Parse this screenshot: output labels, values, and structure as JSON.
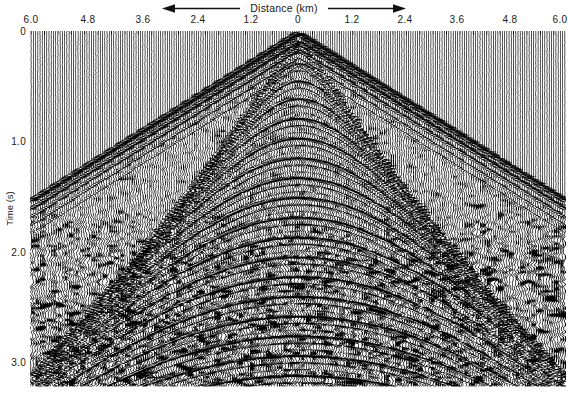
{
  "figure": {
    "kind": "seismic-shot-gather",
    "background_color": "#ffffff",
    "trace_color": "#000000"
  },
  "x_axis": {
    "title": "Distance (km)",
    "title_position": "top",
    "left_arrow": "left-arrow-icon",
    "right_arrow": "right-arrow-icon",
    "tick_labels": [
      "6.0",
      "4.8",
      "3.6",
      "2.4",
      "1.2",
      "0",
      "1.2",
      "2.4",
      "3.6",
      "4.8",
      "6.0"
    ],
    "tick_values": [
      -6.0,
      -4.8,
      -3.6,
      -2.4,
      -1.2,
      0,
      1.2,
      2.4,
      3.6,
      4.8,
      6.0
    ],
    "tick_x_px": [
      31,
      88,
      143,
      198,
      251,
      298,
      352,
      405,
      457,
      510,
      560
    ],
    "range": [
      -6.0,
      6.0
    ],
    "units": "km"
  },
  "y_axis": {
    "title": "Time (s)",
    "tick_labels": [
      "0",
      "1.0",
      "2.0",
      "3.0"
    ],
    "tick_values": [
      0,
      1.0,
      2.0,
      3.0
    ],
    "tick_y_px": [
      31,
      141,
      252,
      362
    ],
    "range": [
      0,
      3.24
    ],
    "units": "s",
    "direction": "increasing-downward"
  },
  "plot_area": {
    "left_px": 30,
    "top_px": 31,
    "right_px": 566,
    "bottom_px": 387
  },
  "chart_data": {
    "type": "wiggle-seismic",
    "title": "Distance (km)",
    "xlabel": "Distance (km)",
    "ylabel": "Time (s)",
    "xlim": [
      -6.0,
      6.0
    ],
    "ylim": [
      0,
      3.24
    ],
    "grid": false,
    "legend": "none",
    "n_traces": 240,
    "trace_spacing_km": 0.05,
    "sample_rate_hz": 250,
    "events": [
      {
        "name": "direct-arrival-left",
        "type": "linear",
        "t0": 0.02,
        "slope_s_per_km": 0.255,
        "amplitude": 0.95
      },
      {
        "name": "direct-arrival-right",
        "type": "linear",
        "t0": 0.02,
        "slope_s_per_km": 0.255,
        "amplitude": 0.95
      },
      {
        "name": "reflection-1",
        "type": "hyperbolic",
        "t0": 0.14,
        "velocity_km_s": 1.6,
        "amplitude": 0.55
      },
      {
        "name": "reflection-2",
        "type": "hyperbolic",
        "t0": 0.3,
        "velocity_km_s": 1.7,
        "amplitude": 0.6
      },
      {
        "name": "reflection-3",
        "type": "hyperbolic",
        "t0": 0.46,
        "velocity_km_s": 1.78,
        "amplitude": 0.62
      },
      {
        "name": "reflection-4",
        "type": "hyperbolic",
        "t0": 0.62,
        "velocity_km_s": 1.85,
        "amplitude": 0.66
      },
      {
        "name": "reflection-5",
        "type": "hyperbolic",
        "t0": 0.8,
        "velocity_km_s": 1.92,
        "amplitude": 0.7
      },
      {
        "name": "reflection-6",
        "type": "hyperbolic",
        "t0": 0.98,
        "velocity_km_s": 1.98,
        "amplitude": 0.72
      },
      {
        "name": "reflection-7",
        "type": "hyperbolic",
        "t0": 1.16,
        "velocity_km_s": 2.05,
        "amplitude": 0.74
      },
      {
        "name": "reflection-8",
        "type": "hyperbolic",
        "t0": 1.34,
        "velocity_km_s": 2.12,
        "amplitude": 0.76
      },
      {
        "name": "reflection-9",
        "type": "hyperbolic",
        "t0": 1.52,
        "velocity_km_s": 2.18,
        "amplitude": 0.78
      },
      {
        "name": "reflection-10",
        "type": "hyperbolic",
        "t0": 1.7,
        "velocity_km_s": 2.24,
        "amplitude": 0.8
      },
      {
        "name": "reflection-11",
        "type": "hyperbolic",
        "t0": 1.88,
        "velocity_km_s": 2.3,
        "amplitude": 0.82
      },
      {
        "name": "reflection-12",
        "type": "hyperbolic",
        "t0": 2.06,
        "velocity_km_s": 2.36,
        "amplitude": 0.84
      },
      {
        "name": "reflection-13",
        "type": "hyperbolic",
        "t0": 2.24,
        "velocity_km_s": 2.42,
        "amplitude": 0.86
      },
      {
        "name": "reflection-14",
        "type": "hyperbolic",
        "t0": 2.42,
        "velocity_km_s": 2.48,
        "amplitude": 0.88
      },
      {
        "name": "reflection-15",
        "type": "hyperbolic",
        "t0": 2.6,
        "velocity_km_s": 2.54,
        "amplitude": 0.88
      },
      {
        "name": "reflection-16",
        "type": "hyperbolic",
        "t0": 2.78,
        "velocity_km_s": 2.6,
        "amplitude": 0.88
      },
      {
        "name": "reflection-17",
        "type": "hyperbolic",
        "t0": 2.96,
        "velocity_km_s": 2.66,
        "amplitude": 0.86
      },
      {
        "name": "reflection-18",
        "type": "hyperbolic",
        "t0": 3.14,
        "velocity_km_s": 2.72,
        "amplitude": 0.84
      }
    ],
    "noise": {
      "background_level": 0.08,
      "coda_onset_s": 1.55,
      "coda_level": 0.62
    }
  }
}
